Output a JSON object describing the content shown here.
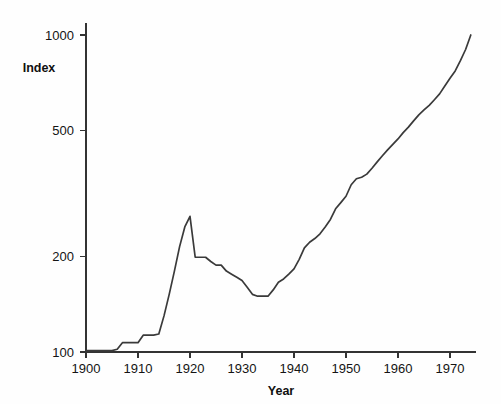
{
  "chart_data": {
    "type": "line",
    "title": "",
    "xlabel": "Year",
    "ylabel": "Index",
    "yscale": "log",
    "xscale": "linear",
    "xlim": [
      1900,
      1975
    ],
    "ylim": [
      100,
      1000
    ],
    "grid": false,
    "legend": null,
    "x_ticks": [
      1900,
      1910,
      1920,
      1930,
      1940,
      1950,
      1960,
      1970
    ],
    "x_tick_labels": [
      "1900",
      "1910",
      "1920",
      "1930",
      "1940",
      "1950",
      "1960",
      "1970"
    ],
    "y_ticks": [
      100,
      200,
      500,
      1000
    ],
    "y_tick_labels": [
      "100",
      "200",
      "500",
      "1000"
    ],
    "line_color": "#3a3a3a",
    "series": [
      {
        "name": "Index",
        "x": [
          1900,
          1901,
          1902,
          1903,
          1904,
          1905,
          1906,
          1907,
          1908,
          1909,
          1910,
          1911,
          1912,
          1913,
          1914,
          1915,
          1916,
          1917,
          1918,
          1919,
          1920,
          1921,
          1922,
          1923,
          1924,
          1925,
          1926,
          1927,
          1928,
          1929,
          1930,
          1931,
          1932,
          1933,
          1934,
          1935,
          1936,
          1937,
          1938,
          1939,
          1940,
          1941,
          1942,
          1943,
          1944,
          1945,
          1946,
          1947,
          1948,
          1949,
          1950,
          1951,
          1952,
          1953,
          1954,
          1955,
          1956,
          1957,
          1958,
          1959,
          1960,
          1961,
          1962,
          1963,
          1964,
          1965,
          1966,
          1967,
          1968,
          1969,
          1970,
          1971,
          1972,
          1973,
          1974
        ],
        "y": [
          101,
          101,
          101,
          101,
          101,
          101,
          102,
          107,
          107,
          107,
          107,
          113,
          113,
          113,
          114,
          130,
          152,
          180,
          215,
          248,
          268,
          199,
          199,
          199,
          193,
          188,
          188,
          180,
          176,
          172,
          168,
          160,
          152,
          150,
          150,
          150,
          157,
          166,
          170,
          176,
          183,
          196,
          213,
          222,
          228,
          236,
          248,
          262,
          283,
          296,
          310,
          337,
          352,
          356,
          364,
          380,
          398,
          416,
          434,
          452,
          470,
          492,
          512,
          536,
          560,
          580,
          600,
          625,
          652,
          690,
          730,
          770,
          830,
          900,
          1000
        ]
      }
    ],
    "annotations": []
  },
  "axis": {
    "y_title": "Index",
    "x_title": "Year"
  }
}
